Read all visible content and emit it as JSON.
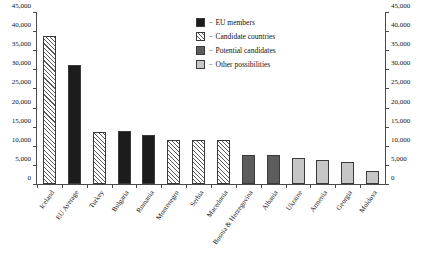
{
  "chart_data": {
    "type": "bar",
    "title": "",
    "subtitle": "",
    "xlabel": "",
    "ylabel": "",
    "ylim": [
      0,
      45000
    ],
    "y_ticks": [
      "0",
      "5,000",
      "10,000",
      "15,000",
      "20,000",
      "25,000",
      "30,000",
      "35,000",
      "40,000",
      "45,000"
    ],
    "y_tick_values": [
      0,
      5000,
      10000,
      15000,
      20000,
      25000,
      30000,
      35000,
      40000,
      45000
    ],
    "dual_axis": true,
    "right_axis_same_as_left": true,
    "grid": false,
    "legend_position": "top-center",
    "categories": [
      "Iceland",
      "EU Average",
      "Turkey",
      "Bulgaria",
      "Romania",
      "Montenegro",
      "Serbia",
      "Macedonia",
      "Bosnia & Herzegovina",
      "Albania",
      "Ukraine",
      "Armenia",
      "Georgia",
      "Moldova"
    ],
    "values": [
      38800,
      31200,
      13700,
      13800,
      12900,
      11600,
      11500,
      11500,
      7700,
      7700,
      6700,
      6300,
      5700,
      3400
    ],
    "groups": [
      "candidate",
      "eu",
      "candidate",
      "eu",
      "eu",
      "candidate",
      "candidate",
      "candidate",
      "potential",
      "potential",
      "other",
      "other",
      "other",
      "other"
    ],
    "legend": [
      {
        "key": "eu",
        "label": "EU members",
        "color": "#1c1c1c"
      },
      {
        "key": "candidate",
        "label": "Candidate countries",
        "color": "#ffffff"
      },
      {
        "key": "potential",
        "label": "Potential candidates",
        "color": "#5c5c5c"
      },
      {
        "key": "other",
        "label": "Other possibilities",
        "color": "#c6c6c6"
      }
    ],
    "legend_separator": "–"
  }
}
